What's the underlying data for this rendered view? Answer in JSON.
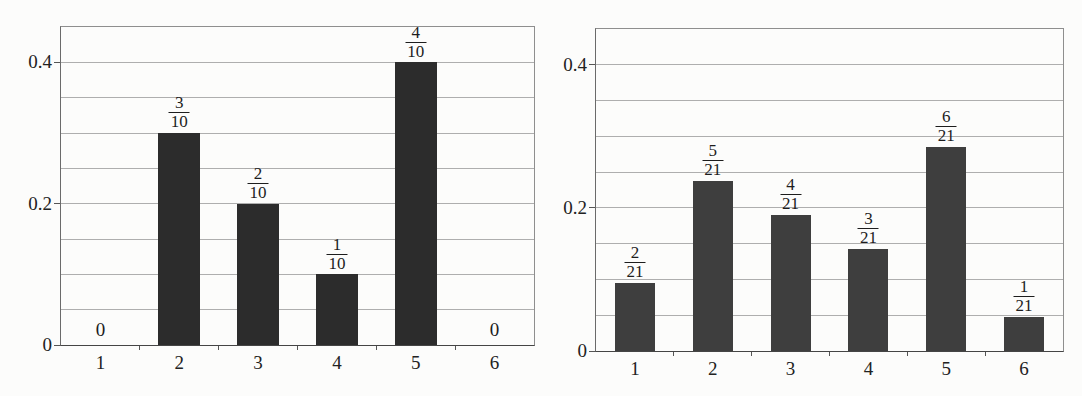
{
  "figure": {
    "background": "#fcfcfb"
  },
  "palette": {
    "grid": "#a0a0a0",
    "frame": "#8e8e8e",
    "axis": "#454545",
    "text": "#1f1f1f",
    "left_bar": "#2c2c2c",
    "right_bar": "#3e3e3e"
  },
  "chart_data": [
    {
      "type": "bar",
      "title": "",
      "xlabel": "",
      "ylabel": "",
      "categories": [
        "1",
        "2",
        "3",
        "4",
        "5",
        "6"
      ],
      "values": [
        0,
        0.3,
        0.2,
        0.1,
        0.4,
        0
      ],
      "bar_labels": [
        {
          "text": "0"
        },
        {
          "num": "3",
          "den": "10"
        },
        {
          "num": "2",
          "den": "10"
        },
        {
          "num": "1",
          "den": "10"
        },
        {
          "num": "4",
          "den": "10"
        },
        {
          "text": "0"
        }
      ],
      "ylim": [
        0,
        0.45
      ],
      "grid_step": 0.05,
      "grid": true,
      "legend": null,
      "yticks": [
        {
          "value": 0,
          "label": "0"
        },
        {
          "value": 0.2,
          "label": "0.2"
        },
        {
          "value": 0.4,
          "label": "0.4"
        }
      ],
      "bar_color": "#2c2c2c"
    },
    {
      "type": "bar",
      "title": "",
      "xlabel": "",
      "ylabel": "",
      "categories": [
        "1",
        "2",
        "3",
        "4",
        "5",
        "6"
      ],
      "values": [
        0.095238,
        0.238095,
        0.190476,
        0.142857,
        0.285714,
        0.047619
      ],
      "bar_labels": [
        {
          "num": "2",
          "den": "21"
        },
        {
          "num": "5",
          "den": "21"
        },
        {
          "num": "4",
          "den": "21"
        },
        {
          "num": "3",
          "den": "21"
        },
        {
          "num": "6",
          "den": "21"
        },
        {
          "num": "1",
          "den": "21"
        }
      ],
      "ylim": [
        0,
        0.45
      ],
      "grid_step": 0.05,
      "grid": true,
      "legend": null,
      "yticks": [
        {
          "value": 0,
          "label": "0"
        },
        {
          "value": 0.2,
          "label": "0.2"
        },
        {
          "value": 0.4,
          "label": "0.4"
        }
      ],
      "bar_color": "#3e3e3e"
    }
  ]
}
